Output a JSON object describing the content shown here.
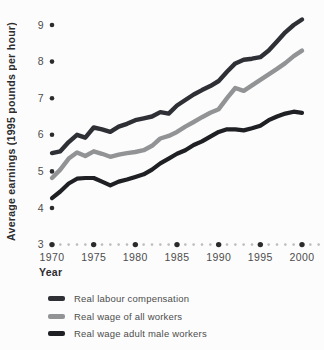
{
  "figure": {
    "background": "#fcfcfc"
  },
  "chart_data": {
    "type": "line",
    "title": "",
    "ylabel": "Average earnings (1995 pounds per hour)",
    "xlabel": "Year",
    "ylim": [
      3,
      9
    ],
    "xlim": [
      1970,
      2003
    ],
    "grid": false,
    "legend_position": "below",
    "y_ticks": [
      3,
      4,
      5,
      6,
      7,
      8,
      9
    ],
    "x_ticks": [
      1970,
      1975,
      1980,
      1985,
      1990,
      1995,
      2000
    ],
    "x": [
      1970,
      1971,
      1972,
      1973,
      1974,
      1975,
      1976,
      1977,
      1978,
      1979,
      1980,
      1981,
      1982,
      1983,
      1984,
      1985,
      1986,
      1987,
      1988,
      1989,
      1990,
      1991,
      1992,
      1993,
      1994,
      1995,
      1996,
      1997,
      1998,
      1999,
      2000
    ],
    "series": [
      {
        "name": "Real labour compensation",
        "color": "#2e3036",
        "width": 4.4,
        "values": [
          5.5,
          5.55,
          5.8,
          6.0,
          5.92,
          6.2,
          6.15,
          6.08,
          6.22,
          6.3,
          6.4,
          6.45,
          6.5,
          6.62,
          6.58,
          6.8,
          6.95,
          7.1,
          7.22,
          7.33,
          7.47,
          7.72,
          7.95,
          8.05,
          8.08,
          8.12,
          8.3,
          8.55,
          8.8,
          9.0,
          9.15
        ]
      },
      {
        "name": "Real wage of all workers",
        "color": "#919395",
        "width": 4.4,
        "values": [
          4.82,
          5.05,
          5.35,
          5.52,
          5.42,
          5.55,
          5.48,
          5.4,
          5.46,
          5.5,
          5.53,
          5.58,
          5.7,
          5.9,
          5.97,
          6.08,
          6.22,
          6.35,
          6.48,
          6.6,
          6.7,
          7.0,
          7.28,
          7.2,
          7.35,
          7.5,
          7.65,
          7.8,
          7.96,
          8.15,
          8.3
        ]
      },
      {
        "name": "Real wage adult male workers",
        "color": "#1e2024",
        "width": 4.2,
        "values": [
          4.27,
          4.45,
          4.67,
          4.8,
          4.82,
          4.82,
          4.72,
          4.62,
          4.72,
          4.78,
          4.85,
          4.92,
          5.05,
          5.22,
          5.35,
          5.48,
          5.58,
          5.72,
          5.82,
          5.95,
          6.08,
          6.15,
          6.15,
          6.12,
          6.18,
          6.25,
          6.4,
          6.5,
          6.58,
          6.63,
          6.6
        ]
      }
    ],
    "axis_dot_color": "#2b2b2b",
    "minor_dot_color": "#bdbdbd",
    "tick_label_color": "#4d4d4d"
  }
}
